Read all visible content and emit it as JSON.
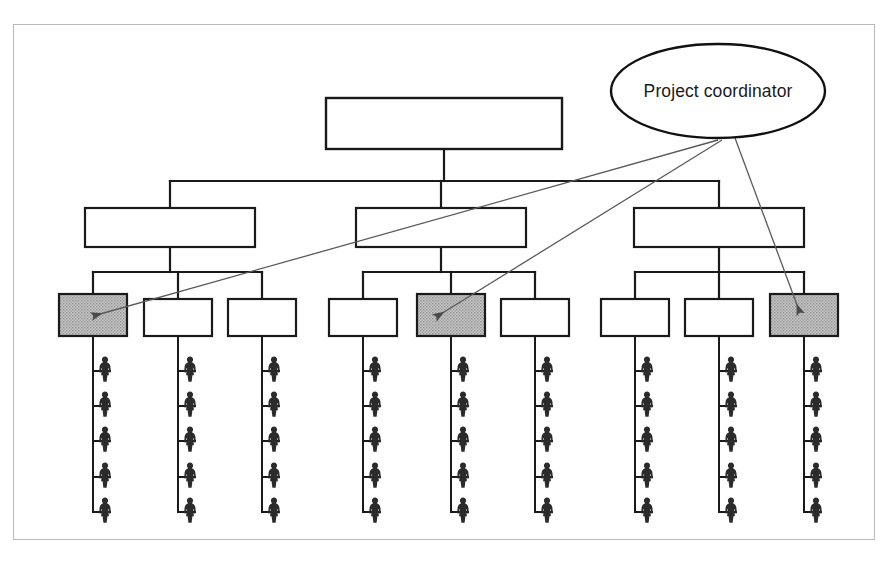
{
  "page": {
    "background_color": "#ffffff",
    "cut_off_header_text": "",
    "frame": {
      "border_color": "#b9b9b9",
      "x": 13,
      "y": 24,
      "width": 862,
      "height": 516
    }
  },
  "diagram": {
    "type": "organizational-hierarchy-chart",
    "line_color": "#1a1a1a",
    "shaded_fill_color": "#b3b3b3",
    "blank_fill_color": "#ffffff",
    "arrow_color": "#555555",
    "annotation": {
      "shape": "ellipse",
      "label": "Project coordinator",
      "cx": 718,
      "cy": 91,
      "rx": 107,
      "ry": 47,
      "arrows_out": 3
    },
    "levels": [
      {
        "level": 1,
        "name": "top-unit",
        "nodes": [
          {
            "id": "n1-1",
            "label": "",
            "x": 326,
            "y": 98,
            "w": 236,
            "h": 51,
            "shaded": false
          }
        ]
      },
      {
        "level": 2,
        "name": "division-units",
        "nodes": [
          {
            "id": "n2-1",
            "label": "",
            "x": 85,
            "y": 208,
            "w": 170,
            "h": 39,
            "shaded": false
          },
          {
            "id": "n2-2",
            "label": "",
            "x": 356,
            "y": 208,
            "w": 170,
            "h": 39,
            "shaded": false
          },
          {
            "id": "n2-3",
            "label": "",
            "x": 634,
            "y": 208,
            "w": 170,
            "h": 39,
            "shaded": false
          }
        ]
      },
      {
        "level": 3,
        "name": "team-units",
        "nodes": [
          {
            "id": "n3-1",
            "label": "",
            "x": 59,
            "y": 294,
            "w": 68,
            "h": 42,
            "shaded": true
          },
          {
            "id": "n3-2",
            "label": "",
            "x": 144,
            "y": 299,
            "w": 68,
            "h": 37,
            "shaded": false
          },
          {
            "id": "n3-3",
            "label": "",
            "x": 228,
            "y": 299,
            "w": 68,
            "h": 37,
            "shaded": false
          },
          {
            "id": "n3-4",
            "label": "",
            "x": 329,
            "y": 299,
            "w": 68,
            "h": 37,
            "shaded": false
          },
          {
            "id": "n3-5",
            "label": "",
            "x": 417,
            "y": 294,
            "w": 68,
            "h": 42,
            "shaded": true
          },
          {
            "id": "n3-6",
            "label": "",
            "x": 501,
            "y": 299,
            "w": 68,
            "h": 37,
            "shaded": false
          },
          {
            "id": "n3-7",
            "label": "",
            "x": 601,
            "y": 299,
            "w": 68,
            "h": 37,
            "shaded": false
          },
          {
            "id": "n3-8",
            "label": "",
            "x": 685,
            "y": 299,
            "w": 68,
            "h": 37,
            "shaded": false
          },
          {
            "id": "n3-9",
            "label": "",
            "x": 770,
            "y": 294,
            "w": 68,
            "h": 42,
            "shaded": true
          }
        ]
      }
    ],
    "staff_columns": [
      {
        "parent": "n3-1",
        "x": 93,
        "people": 5
      },
      {
        "parent": "n3-2",
        "x": 178,
        "people": 5
      },
      {
        "parent": "n3-3",
        "x": 262,
        "people": 5
      },
      {
        "parent": "n3-4",
        "x": 363,
        "people": 5
      },
      {
        "parent": "n3-5",
        "x": 451,
        "people": 5
      },
      {
        "parent": "n3-6",
        "x": 535,
        "people": 5
      },
      {
        "parent": "n3-7",
        "x": 635,
        "people": 5
      },
      {
        "parent": "n3-8",
        "x": 719,
        "people": 5
      },
      {
        "parent": "n3-9",
        "x": 804,
        "people": 5
      }
    ],
    "staff_icon": "person-icon",
    "people_per_column": 5,
    "total_people": 45,
    "coordinator_arrow_targets": [
      "n3-1",
      "n3-5",
      "n3-9"
    ]
  }
}
